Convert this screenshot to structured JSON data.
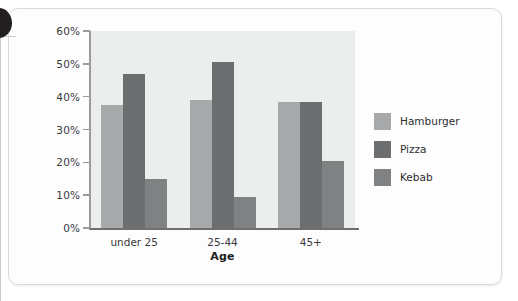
{
  "chart_data": {
    "type": "bar",
    "title": "",
    "subtitle": "",
    "xlabel": "Age",
    "ylabel": "",
    "categories": [
      "under 25",
      "25-44",
      "45+"
    ],
    "series": [
      {
        "name": "Hamburger",
        "color": "#a8a9aa",
        "values": [
          37.5,
          39.0,
          38.5
        ]
      },
      {
        "name": "Pizza",
        "color": "#6d6e70",
        "values": [
          47.0,
          50.5,
          38.5
        ]
      },
      {
        "name": "Kebab",
        "color": "#808182",
        "values": [
          15.0,
          9.5,
          20.5
        ]
      }
    ],
    "ylim": [
      0,
      60
    ],
    "ytick_values": [
      0,
      10,
      20,
      30,
      40,
      50,
      60
    ],
    "ytick_labels": [
      "0%",
      "10%",
      "20%",
      "30%",
      "40%",
      "50%",
      "60%"
    ],
    "grid": false,
    "legend_position": "right",
    "plot_background": "#eceded",
    "axis_color": "#6e6f70"
  },
  "axis": {
    "y_labels": [
      "60%",
      "50%",
      "40%",
      "30%",
      "20%",
      "10%",
      "0%"
    ],
    "x_labels": [
      "under 25",
      "25-44",
      "45+"
    ],
    "x_title": "Age"
  },
  "legend": {
    "items": [
      {
        "label": "Hamburger",
        "color": "#a8a9aa"
      },
      {
        "label": "Pizza",
        "color": "#6d6e70"
      },
      {
        "label": "Kebab",
        "color": "#808182"
      }
    ]
  }
}
